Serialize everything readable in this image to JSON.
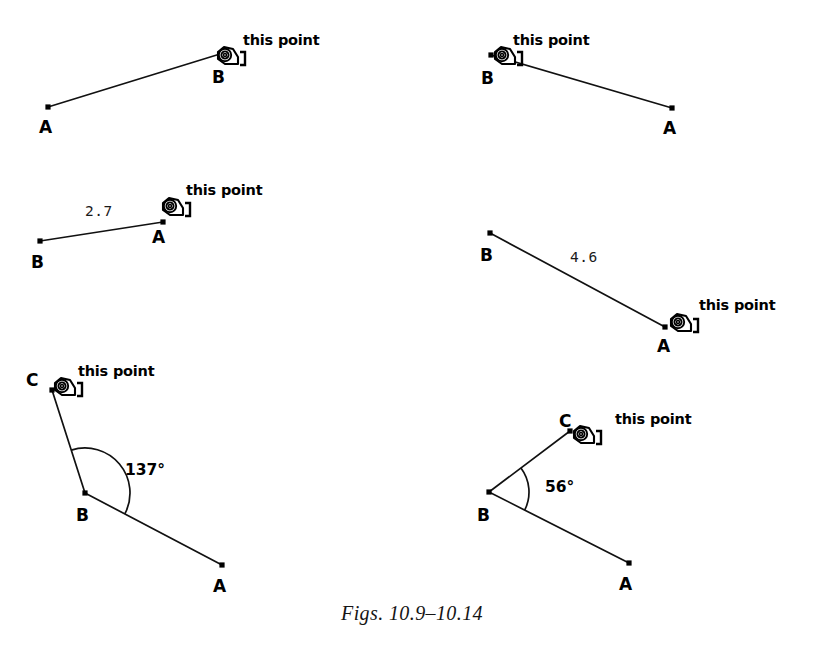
{
  "page": {
    "caption": "Figs. 10.9–10.14",
    "background_color": "#ffffff",
    "ink_color": "#000000",
    "width": 824,
    "height": 664
  },
  "cursor": {
    "icon_name": "hand-pointer-cursor",
    "label": "this point"
  },
  "figures": [
    {
      "id": "fig-10-9",
      "number": "10.9",
      "type": "segment",
      "cursor_label": "this point",
      "cursor_label_pos": {
        "x": 243,
        "y": 45
      },
      "cursor_pos": {
        "x": 227,
        "y": 57
      },
      "cursor_target": "B",
      "points": [
        {
          "name": "A",
          "x": 48,
          "y": 107,
          "label_x": 39,
          "label_y": 133
        },
        {
          "name": "B",
          "x": 220,
          "y": 54,
          "label_x": 212,
          "label_y": 83
        }
      ],
      "segments": [
        {
          "from": "A",
          "to": "B"
        }
      ],
      "measurement": null,
      "angle": null
    },
    {
      "id": "fig-10-10",
      "number": "10.10",
      "type": "segment",
      "cursor_label": "this point",
      "cursor_label_pos": {
        "x": 513,
        "y": 45
      },
      "cursor_pos": {
        "x": 504,
        "y": 57
      },
      "cursor_target": "B",
      "points": [
        {
          "name": "B",
          "x": 491,
          "y": 55,
          "label_x": 481,
          "label_y": 84
        },
        {
          "name": "A",
          "x": 672,
          "y": 108,
          "label_x": 663,
          "label_y": 134
        }
      ],
      "segments": [
        {
          "from": "B",
          "to": "A"
        }
      ],
      "measurement": null,
      "angle": null
    },
    {
      "id": "fig-10-11",
      "number": "10.11",
      "type": "segment-measured",
      "cursor_label": "this point",
      "cursor_label_pos": {
        "x": 186,
        "y": 195
      },
      "cursor_pos": {
        "x": 172,
        "y": 208
      },
      "cursor_target": "A",
      "points": [
        {
          "name": "B",
          "x": 40,
          "y": 241,
          "label_x": 31,
          "label_y": 268
        },
        {
          "name": "A",
          "x": 163,
          "y": 222,
          "label_x": 152,
          "label_y": 243
        }
      ],
      "segments": [
        {
          "from": "B",
          "to": "A"
        }
      ],
      "measurement": {
        "value": "2.7",
        "x": 85,
        "y": 216
      },
      "angle": null
    },
    {
      "id": "fig-10-12",
      "number": "10.12",
      "type": "segment-measured",
      "cursor_label": "this point",
      "cursor_label_pos": {
        "x": 699,
        "y": 310
      },
      "cursor_pos": {
        "x": 680,
        "y": 324
      },
      "cursor_target": "A",
      "points": [
        {
          "name": "B",
          "x": 490,
          "y": 233,
          "label_x": 480,
          "label_y": 261
        },
        {
          "name": "A",
          "x": 665,
          "y": 327,
          "label_x": 657,
          "label_y": 352
        }
      ],
      "segments": [
        {
          "from": "B",
          "to": "A"
        }
      ],
      "measurement": {
        "value": "4.6",
        "x": 570,
        "y": 262
      },
      "angle": null
    },
    {
      "id": "fig-10-13",
      "number": "10.13",
      "type": "angle",
      "cursor_label": "this point",
      "cursor_label_pos": {
        "x": 78,
        "y": 376
      },
      "cursor_pos": {
        "x": 64,
        "y": 388
      },
      "cursor_target": "C",
      "points": [
        {
          "name": "C",
          "x": 52,
          "y": 390,
          "label_x": 26,
          "label_y": 386
        },
        {
          "name": "B",
          "x": 85,
          "y": 493,
          "label_x": 76,
          "label_y": 521
        },
        {
          "name": "A",
          "x": 222,
          "y": 565,
          "label_x": 213,
          "label_y": 592
        }
      ],
      "segments": [
        {
          "from": "C",
          "to": "B"
        },
        {
          "from": "B",
          "to": "A"
        }
      ],
      "measurement": null,
      "angle": {
        "value": "137°",
        "x": 125,
        "y": 475,
        "radius": 45
      }
    },
    {
      "id": "fig-10-14",
      "number": "10.14",
      "type": "angle",
      "cursor_label": "this point",
      "cursor_label_pos": {
        "x": 615,
        "y": 424
      },
      "cursor_pos": {
        "x": 583,
        "y": 436
      },
      "cursor_target": "C",
      "points": [
        {
          "name": "C",
          "x": 570,
          "y": 431,
          "label_x": 559,
          "label_y": 427
        },
        {
          "name": "B",
          "x": 489,
          "y": 492,
          "label_x": 477,
          "label_y": 521
        },
        {
          "name": "A",
          "x": 629,
          "y": 563,
          "label_x": 619,
          "label_y": 590
        }
      ],
      "segments": [
        {
          "from": "C",
          "to": "B"
        },
        {
          "from": "B",
          "to": "A"
        }
      ],
      "measurement": null,
      "angle": {
        "value": "56°",
        "x": 545,
        "y": 492,
        "radius": 40
      }
    }
  ]
}
